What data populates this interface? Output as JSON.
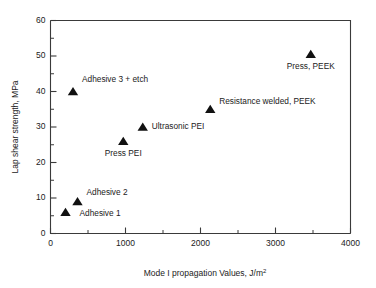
{
  "chart_data": {
    "type": "scatter",
    "title": "",
    "xlabel": "Mode I propagation Values, J/m2",
    "xlabel_main": "Mode I propagation Values, J/m",
    "xlabel_sup": "2",
    "ylabel": "Lap shear strength, MPa",
    "xlim": [
      0,
      4000
    ],
    "ylim": [
      0,
      60
    ],
    "x_major_ticks": [
      0,
      1000,
      2000,
      3000,
      4000
    ],
    "x_tick_labels": [
      "0",
      "1000",
      "2000",
      "3000",
      "4000"
    ],
    "x_minor_ticks": [
      500,
      1500,
      2500,
      3500
    ],
    "y_major_ticks": [
      0,
      10,
      20,
      30,
      40,
      50,
      60
    ],
    "y_tick_labels": [
      "0",
      "10",
      "20",
      "30",
      "40",
      "50",
      "60"
    ],
    "y_minor_ticks": [
      5,
      15,
      25,
      35,
      45,
      55
    ],
    "grid": false,
    "legend": "none",
    "marker": "triangle-up",
    "marker_color": "#111111",
    "points": [
      {
        "label": "Adhesive 1",
        "x": 200,
        "y": 6.0,
        "label_dx": 14,
        "label_dy": 3.5,
        "anchor": "start"
      },
      {
        "label": "Adhesive 2",
        "x": 360,
        "y": 9.0,
        "label_dx": 9,
        "label_dy": -6.5,
        "anchor": "start"
      },
      {
        "label": "Adhesive 3 + etch",
        "x": 300,
        "y": 40.0,
        "label_dx": 9,
        "label_dy": -10,
        "anchor": "start"
      },
      {
        "label": "Press PEI",
        "x": 970,
        "y": 26.0,
        "label_dx": 0,
        "label_dy": 15,
        "anchor": "middle"
      },
      {
        "label": "Ultrasonic PEI",
        "x": 1230,
        "y": 30.0,
        "label_dx": 9,
        "label_dy": 1.5,
        "anchor": "start"
      },
      {
        "label": "Resistance welded, PEEK",
        "x": 2130,
        "y": 35.0,
        "label_dx": 9,
        "label_dy": -5.5,
        "anchor": "start"
      },
      {
        "label": "Press, PEEK",
        "x": 3470,
        "y": 50.5,
        "label_dx": 0,
        "label_dy": 15,
        "anchor": "middle"
      }
    ]
  }
}
